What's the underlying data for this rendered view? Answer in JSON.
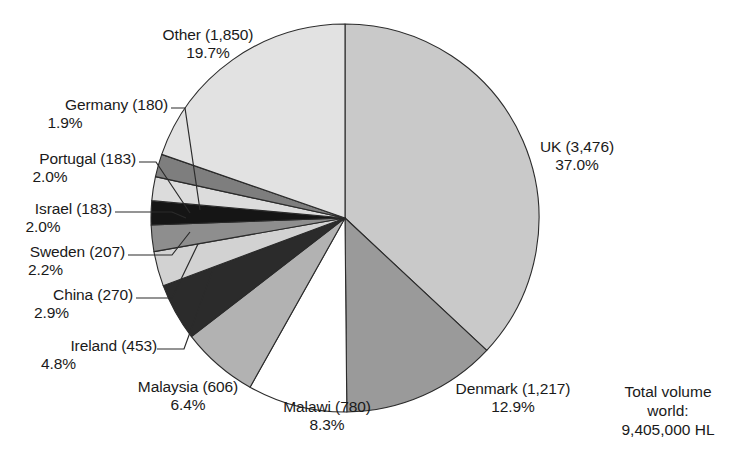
{
  "chart_data": {
    "type": "pie",
    "title": "",
    "unit": "HL",
    "total_label_lines": [
      "Total volume",
      "world:",
      "9,405,000 HL"
    ],
    "total_value": 9405000,
    "categories": [
      "UK",
      "Denmark",
      "Malawi",
      "Malaysia",
      "Ireland",
      "China",
      "Sweden",
      "Israel",
      "Portugal",
      "Germany",
      "Other"
    ],
    "values": [
      3476,
      1217,
      780,
      606,
      453,
      270,
      207,
      183,
      183,
      180,
      1850
    ],
    "percentages": [
      37.0,
      12.9,
      8.3,
      6.4,
      4.8,
      2.9,
      2.2,
      2.0,
      2.0,
      1.9,
      19.7
    ],
    "value_labels": [
      "3,476",
      "1,217",
      "780",
      "606",
      "453",
      "270",
      "207",
      "183",
      "183",
      "180",
      "1,850"
    ],
    "percent_labels": [
      "37.0%",
      "12.9%",
      "8.3%",
      "6.4%",
      "4.8%",
      "2.9%",
      "2.2%",
      "2.0%",
      "2.0%",
      "1.9%",
      "19.7%"
    ],
    "colors": [
      "#c9c9c9",
      "#9a9a9a",
      "#ffffff",
      "#b2b2b2",
      "#2b2b2b",
      "#d2d2d2",
      "#8e8e8e",
      "#151515",
      "#dcdcdc",
      "#7e7e7e",
      "#e2e2e2"
    ],
    "start_angle_deg": 0,
    "direction": "clockwise",
    "legend": "none",
    "grid": false
  },
  "slices": [
    {
      "name": "UK",
      "label_line1": "UK (3,476)",
      "label_line2": "37.0%"
    },
    {
      "name": "Denmark",
      "label_line1": "Denmark (1,217)",
      "label_line2": "12.9%"
    },
    {
      "name": "Malawi",
      "label_line1": "Malawi (780)",
      "label_line2": "8.3%"
    },
    {
      "name": "Malaysia",
      "label_line1": "Malaysia (606)",
      "label_line2": "6.4%"
    },
    {
      "name": "Ireland",
      "label_line1": "Ireland (453)",
      "label_line2": "4.8%"
    },
    {
      "name": "China",
      "label_line1": "China (270)",
      "label_line2": "2.9%"
    },
    {
      "name": "Sweden",
      "label_line1": "Sweden (207)",
      "label_line2": "2.2%"
    },
    {
      "name": "Israel",
      "label_line1": "Israel (183)",
      "label_line2": "2.0%"
    },
    {
      "name": "Portugal",
      "label_line1": "Portugal (183)",
      "label_line2": "2.0%"
    },
    {
      "name": "Germany",
      "label_line1": "Germany (180)",
      "label_line2": "1.9%"
    },
    {
      "name": "Other",
      "label_line1": "Other (1,850)",
      "label_line2": "19.7%"
    }
  ],
  "total_note": {
    "line1": "Total volume",
    "line2": "world:",
    "line3": "9,405,000 HL"
  }
}
